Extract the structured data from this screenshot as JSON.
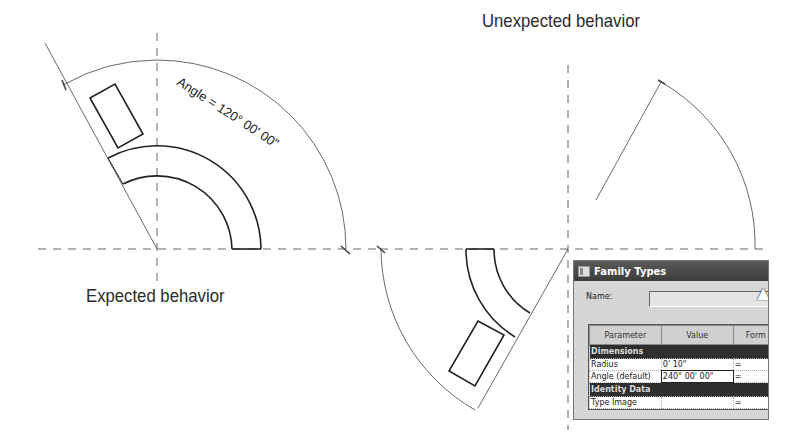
{
  "captions": {
    "expected": "Expected behavior",
    "unexpected": "Unexpected behavior"
  },
  "annotations": {
    "angle_label": "Angle = 120° 00' 00\""
  },
  "dialog": {
    "title": "Family Types",
    "name_label": "Name:",
    "name_value": "",
    "columns": [
      "Parameter",
      "Value",
      "Form"
    ],
    "groups": [
      {
        "label": "Dimensions",
        "rows": [
          {
            "parameter": "Radius",
            "value": "0'  10\"",
            "formula": "="
          },
          {
            "parameter": "Angle (default)",
            "value": "240° 00' 00\"",
            "formula": "="
          }
        ]
      },
      {
        "label": "Identity Data",
        "rows": [
          {
            "parameter": "Type Image",
            "value": "",
            "formula": "="
          }
        ]
      }
    ]
  },
  "colors": {
    "line": "#222222",
    "reference": "#555555",
    "dialog_bg": "#d6d6d6",
    "titlebar": "#3c3c3c"
  }
}
